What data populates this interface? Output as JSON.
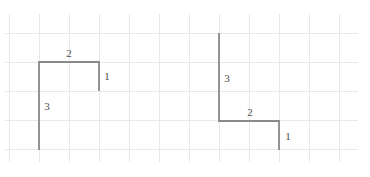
{
  "figure": {
    "colors": {
      "background": "#ffffff",
      "grid_line": "#e9e9e9",
      "path_stroke": "#8a8a8a",
      "label_text": "#4f4f4f"
    },
    "grid": {
      "column_spacing_px": 30,
      "row_spacing_px": 29
    },
    "left_path": {
      "shape": "open rectangle: long vertical up, horizontal right, short vertical down",
      "points": "39,150 39,62 99,62 99,91",
      "labels": {
        "top_horizontal": "2",
        "right_vertical": "1",
        "left_vertical": "3"
      }
    },
    "right_path": {
      "shape": "long vertical down, horizontal right, short vertical down",
      "points": "219,33 219,121 279,121 279,150",
      "labels": {
        "upper_vertical": "3",
        "horizontal": "2",
        "lower_vertical": "1"
      }
    }
  }
}
